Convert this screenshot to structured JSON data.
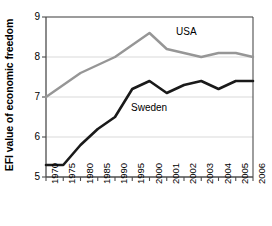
{
  "chart_data": {
    "type": "line",
    "title": "",
    "subtitle": "",
    "xlabel": "",
    "ylabel": "EFI value of economic freedom",
    "categories": [
      "1970",
      "1975",
      "1980",
      "1985",
      "1990",
      "1995",
      "2000",
      "2001",
      "2002",
      "2003",
      "2004",
      "2005",
      "2006"
    ],
    "ylim": [
      5,
      9
    ],
    "yticks": [
      5,
      6,
      7,
      8,
      9
    ],
    "ytick_labels": [
      "5",
      "6",
      "7",
      "8",
      "9"
    ],
    "grid": "horizontal",
    "legend_position": "inline-annotations",
    "series": [
      {
        "name": "USA",
        "color": "#969696",
        "values": [
          7.0,
          7.3,
          7.6,
          7.8,
          8.0,
          8.3,
          8.6,
          8.2,
          8.1,
          8.0,
          8.1,
          8.1,
          8.0
        ]
      },
      {
        "name": "Sweden",
        "color": "#1a1a1a",
        "values": [
          5.3,
          5.3,
          5.8,
          6.2,
          6.5,
          7.2,
          7.4,
          7.1,
          7.3,
          7.4,
          7.2,
          7.4,
          7.4
        ]
      }
    ],
    "annotations": [
      {
        "text": "USA",
        "series": "USA"
      },
      {
        "text": "Sweden",
        "series": "Sweden"
      }
    ]
  },
  "colors": {
    "usa_line": "#969696",
    "sweden_line": "#1a1a1a",
    "axis": "#4d4d4d",
    "grid": "#d9d9d9",
    "background": "#ffffff",
    "text": "#000000"
  }
}
